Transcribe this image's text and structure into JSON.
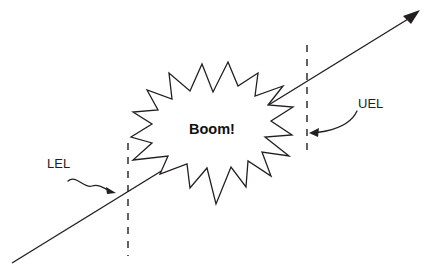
{
  "diagram": {
    "background_color": "#ffffff",
    "stroke_color": "#231f20",
    "labels": {
      "lower_limit": "LEL",
      "upper_limit": "UEL",
      "explosion": "Boom!"
    },
    "elements": {
      "trend_arrow_name": "concentration-trend-arrow",
      "lower_boundary_name": "lel-dashed-boundary",
      "upper_boundary_name": "uel-dashed-boundary",
      "burst_name": "explosion-starburst"
    },
    "geometry": {
      "trend_line": "M 12 263 L 413 16",
      "trend_arrowhead": "M 420 10 L 403 16 L 411 24 Z",
      "lel_dash_x": 128,
      "lel_dash_top": 143,
      "lel_dash_bottom": 256,
      "uel_dash_x": 307,
      "uel_dash_top": 45,
      "uel_dash_bottom": 157,
      "burst_path": "M 228 62 L 238 86 L 258 73 L 255 96 L 283 86 L 268 105 L 293 107 L 271 121 L 292 135 L 265 137 L 289 156 L 262 152 L 271 176 L 248 161 L 246 187 L 231 167 L 216 204 L 207 168 L 190 188 L 187 164 L 160 174 L 168 156 L 133 160 L 152 143 L 131 137 L 152 124 L 133 112 L 158 110 L 147 90 L 172 99 L 169 73 L 190 91 L 202 64 L 213 92 Z",
      "lel_curve": "M 68 181 C 76 174, 84 189, 92 186 C 99 184, 104 188, 110 191",
      "lel_arrowhead": "M 116 193 L 106 187 L 107 194 Z",
      "uel_curve": "M 357 111 C 352 122, 340 128, 326 131 C 322 132, 318 132, 314 133",
      "uel_arrowhead": "M 309 133 L 319 128 L 318 137 Z",
      "lel_text_pos": {
        "x": 47,
        "y": 168
      },
      "uel_text_pos": {
        "x": 358,
        "y": 108
      },
      "boom_text_pos": {
        "x": 212,
        "y": 134
      }
    }
  }
}
